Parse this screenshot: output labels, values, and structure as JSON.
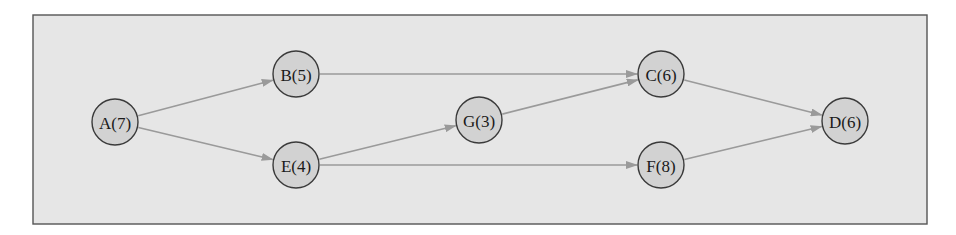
{
  "diagram": {
    "type": "directed-graph",
    "frame": {
      "x": 33,
      "y": 15,
      "width": 894,
      "height": 209,
      "fill": "#e6e6e6",
      "stroke": "#555555"
    },
    "node_style": {
      "radius": 23,
      "fill": "#d2d2d2",
      "stroke": "#3a3a3a"
    },
    "edge_color": "#9a9a9a",
    "nodes": [
      {
        "id": "A",
        "label": "A(7)",
        "duration": 7,
        "x": 115,
        "y": 122
      },
      {
        "id": "B",
        "label": "B(5)",
        "duration": 5,
        "x": 296,
        "y": 74
      },
      {
        "id": "E",
        "label": "E(4)",
        "duration": 4,
        "x": 296,
        "y": 165
      },
      {
        "id": "G",
        "label": "G(3)",
        "duration": 3,
        "x": 479,
        "y": 120
      },
      {
        "id": "C",
        "label": "C(6)",
        "duration": 6,
        "x": 661,
        "y": 74
      },
      {
        "id": "F",
        "label": "F(8)",
        "duration": 8,
        "x": 661,
        "y": 165
      },
      {
        "id": "D",
        "label": "D(6)",
        "duration": 6,
        "x": 845,
        "y": 121
      }
    ],
    "edges": [
      {
        "from": "A",
        "to": "B"
      },
      {
        "from": "A",
        "to": "E"
      },
      {
        "from": "B",
        "to": "C"
      },
      {
        "from": "E",
        "to": "G"
      },
      {
        "from": "E",
        "to": "F"
      },
      {
        "from": "G",
        "to": "C"
      },
      {
        "from": "C",
        "to": "D"
      },
      {
        "from": "F",
        "to": "D"
      }
    ]
  }
}
